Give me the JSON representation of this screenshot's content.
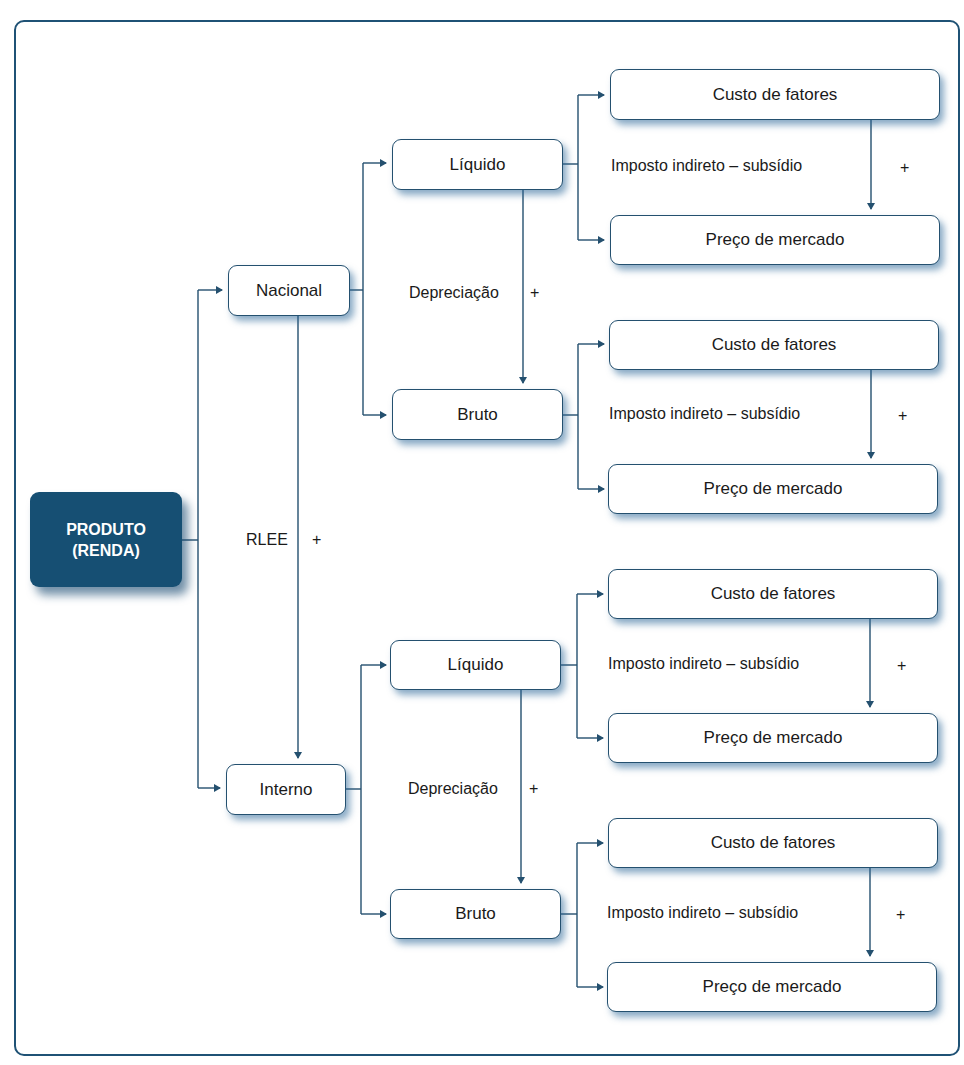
{
  "diagram": {
    "root": {
      "line1": "PRODUTO",
      "line2": "(RENDA)"
    },
    "root_edge_label": "RLEE",
    "level1": [
      {
        "label": "Nacional"
      },
      {
        "label": "Interno"
      }
    ],
    "level2_label": "Depreciação",
    "level2": [
      {
        "label": "Líquido"
      },
      {
        "label": "Bruto"
      },
      {
        "label": "Líquido"
      },
      {
        "label": "Bruto"
      }
    ],
    "level3_edge_label": "Imposto indireto – subsídio",
    "level3": {
      "top": "Custo de fatores",
      "bottom": "Preço de mercado"
    },
    "plus_sign": "+",
    "colors": {
      "primary": "#164f73",
      "line": "#24506f",
      "frame": "#1f5275"
    }
  }
}
